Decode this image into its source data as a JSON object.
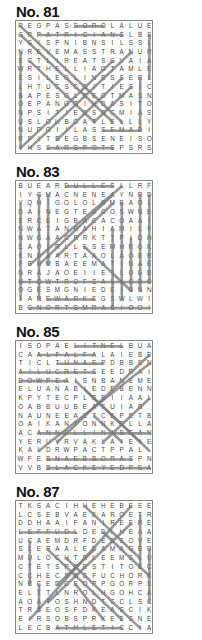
{
  "puzzles": [
    {
      "title": "No. 81",
      "rows": [
        "REGPASSOROLALUE",
        "GRPATRICIANSLBS",
        "YSISPNIBNSILSSL",
        "NREVEMASSTRANUR",
        "ECTLIREATSGVAIA",
        "WRTHELLIAGTAMLE",
        "ESILEGLINESSERL",
        "LHTUCSCGITIESIC",
        "BAPESOLCEOTMASN",
        "OEPANGOIHDASITO",
        "NPSITIESSSCMIAS",
        "USLOHBOATLELLLY",
        "NUPGIILASSEMADI",
        "RFITBEGBSENEISO",
        "YHSSARSPOTSPSRS"
      ],
      "marks": [
        [
          6,
          0,
          9,
          0
        ],
        [
          2,
          1,
          11,
          1
        ],
        [
          3,
          14,
          10,
          14
        ],
        [
          9,
          12,
          13,
          12
        ],
        [
          0,
          3,
          0,
          14
        ],
        [
          14,
          1,
          14,
          6
        ],
        [
          13,
          6,
          13,
          12
        ],
        [
          0,
          0,
          11,
          11
        ],
        [
          0,
          1,
          10,
          11
        ],
        [
          1,
          4,
          8,
          11
        ],
        [
          12,
          3,
          1,
          14
        ],
        [
          10,
          4,
          0,
          14
        ],
        [
          11,
          6,
          4,
          13
        ],
        [
          12,
          7,
          8,
          11
        ]
      ]
    },
    {
      "title": "No. 83",
      "rows": [
        "BUEARDULLESLLRF",
        "IYGMACNENEAYNRD",
        "YQHIGOLOLOMBAOL",
        "DAINEGTEUCOSWNE",
        "ERCEIGBACACOAAI",
        "NWATANRAHIAMILF",
        "NWGAADRRKTTPIDH",
        "EAOIRLLESEMHRGK",
        "KNDAARTAAOLAOER",
        "FEHMBAEEMATINAE",
        "NRAJAOEIIETLOGB",
        "HTOWTROFSALLSDO",
        "OGESMGNIEDEIUNN",
        "IANEWARKEGSWLWI",
        "BGNORTSMRASIOOI"
      ],
      "marks": [
        [
          5,
          0,
          10,
          0
        ],
        [
          0,
          11,
          14,
          11
        ],
        [
          3,
          13,
          8,
          13
        ],
        [
          1,
          14,
          14,
          14
        ],
        [
          0,
          2,
          0,
          13
        ],
        [
          2,
          1,
          2,
          13
        ],
        [
          3,
          1,
          3,
          9
        ],
        [
          10,
          5,
          10,
          14
        ],
        [
          11,
          2,
          11,
          13
        ],
        [
          12,
          6,
          12,
          12
        ],
        [
          13,
          1,
          13,
          12
        ],
        [
          14,
          1,
          14,
          11
        ],
        [
          11,
          0,
          1,
          9
        ],
        [
          10,
          1,
          2,
          9
        ],
        [
          10,
          2,
          4,
          8
        ],
        [
          7,
          7,
          12,
          12
        ]
      ]
    },
    {
      "title": "No. 85",
      "rows": [
        "ISDPAELITNELBUA",
        "CAALFALFALAIEBE",
        "TICLTUNAEPDBBEN",
        "AILUCRETSEEDRAI",
        "DOWPEAISNBANEME",
        "ELUANABIEDEBENN",
        "KPYTECPLBEIIAAL",
        "OABBUUBEAFUIAB",
        "NAUNEEALTCEPETB",
        "OAIKANTONNKELLA",
        "ACANNELLINIBEAN",
        "YERUVRVAKLAIEIE",
        "KALDRWPACTPPAL",
        "WFEBNAEBBORASPN",
        "VVBBLACKEYEDPEA"
      ],
      "marks": [
        [
          6,
          0,
          11,
          0
        ],
        [
          2,
          1,
          8,
          1
        ],
        [
          4,
          2,
          9,
          2
        ],
        [
          0,
          3,
          8,
          3
        ],
        [
          0,
          4,
          5,
          4
        ],
        [
          2,
          10,
          14,
          10
        ],
        [
          3,
          13,
          12,
          13
        ],
        [
          3,
          14,
          14,
          14
        ],
        [
          14,
          1,
          4,
          11
        ],
        [
          14,
          2,
          2,
          12
        ],
        [
          14,
          6,
          9,
          11
        ],
        [
          6,
          4,
          13,
          11
        ],
        [
          7,
          5,
          14,
          12
        ],
        [
          8,
          8,
          11,
          11
        ]
      ]
    },
    {
      "title": "No. 87",
      "rows": [
        "TKSACIHHEHEBEEE",
        "LCSEBVAEEAROETR",
        "DDHAAIFANIREERE",
        "LEFFUDLDEDLHEAA",
        "UCAEMDRFDEESOVE",
        "SLERAALEDAMAGER",
        "MULOCHTRLEEMSLU",
        "CTETSPRESTITOEC",
        "CCHECSOSFUCHORK",
        "NRCEDCEOPPGORPS",
        "ELTTLNROLHGOHCA",
        "AOATOSHNDTCCLSC",
        "TRSEOSFDKEASCIK",
        "EIRSOBSPRKEESNE",
        "LECBATHLETICCIA"
      ],
      "marks": [
        [
          0,
          3,
          6,
          3
        ],
        [
          4,
          14,
          11,
          14
        ],
        [
          1,
          4,
          1,
          9
        ],
        [
          2,
          9,
          2,
          12
        ],
        [
          13,
          1,
          13,
          7
        ],
        [
          14,
          5,
          14,
          11
        ],
        [
          12,
          0,
          1,
          13
        ],
        [
          12,
          2,
          3,
          11
        ],
        [
          8,
          5,
          4,
          9
        ],
        [
          7,
          0,
          13,
          6
        ],
        [
          3,
          5,
          11,
          13
        ],
        [
          5,
          6,
          13,
          14
        ],
        [
          9,
          3,
          14,
          8
        ],
        [
          6,
          9,
          9,
          13
        ]
      ]
    }
  ]
}
